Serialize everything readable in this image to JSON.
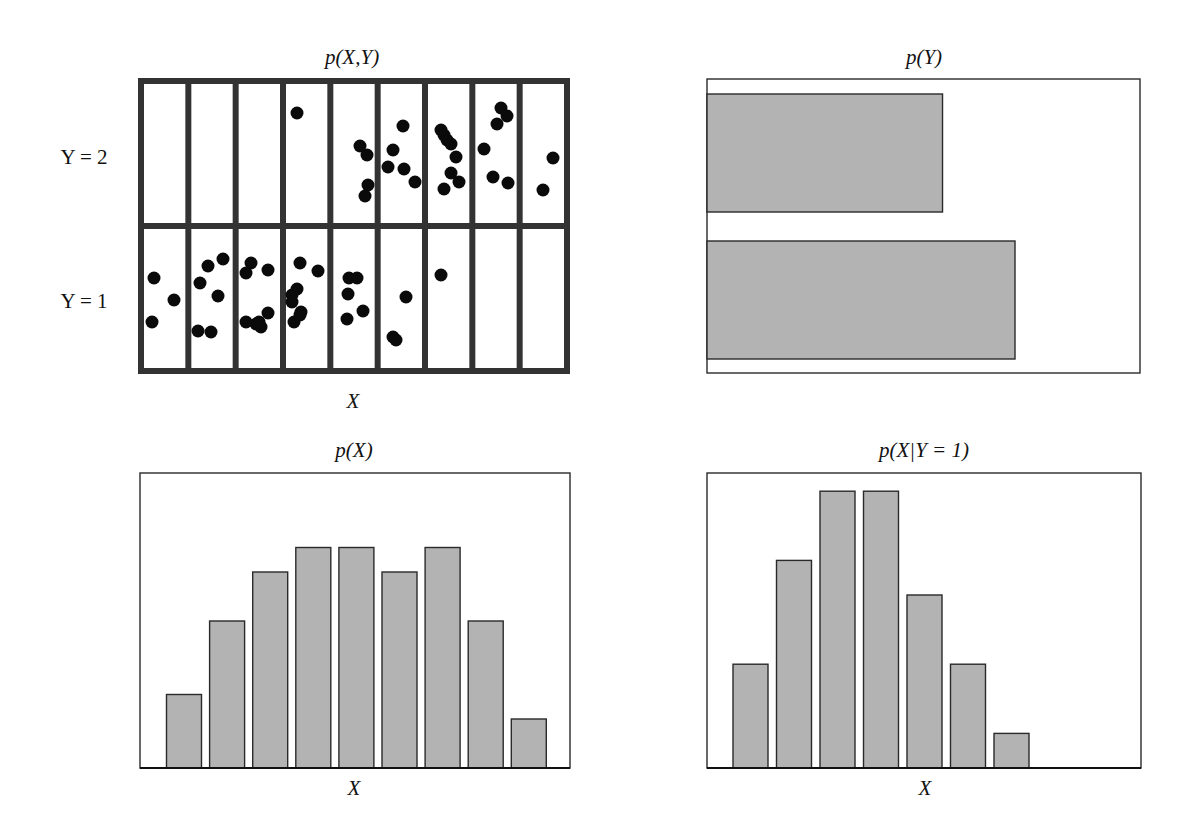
{
  "panels": {
    "joint": {
      "title": "p(X,Y)",
      "xlabel": "X",
      "ylabels": [
        "Y = 2",
        "Y = 1"
      ]
    },
    "marginal_y": {
      "title": "p(Y)"
    },
    "marginal_x": {
      "title": "p(X)",
      "xlabel": "X"
    },
    "conditional": {
      "title": "p(X|Y = 1)",
      "xlabel": "X"
    }
  },
  "colors": {
    "bar_fill": "#b3b3b3",
    "bar_stroke": "#2a2a2a",
    "dot": "#0a0a0a"
  },
  "chart_data": [
    {
      "type": "scatter",
      "title": "p(X,Y)",
      "xlabel": "X",
      "ylabel": "",
      "x_bins": 9,
      "y_categories": [
        "Y = 1",
        "Y = 2"
      ],
      "description": "60 samples binned into a 9x2 grid",
      "counts": {
        "Y = 2": [
          0,
          0,
          0,
          1,
          4,
          5,
          8,
          6,
          2
        ],
        "Y = 1": [
          3,
          6,
          8,
          8,
          5,
          3,
          1,
          0,
          0
        ]
      },
      "points_px": {
        "Y = 2": [
          [
            297,
            113
          ],
          [
            360,
            146
          ],
          [
            367,
            155
          ],
          [
            368,
            185
          ],
          [
            365,
            196
          ],
          [
            403,
            126
          ],
          [
            393,
            150
          ],
          [
            388,
            167
          ],
          [
            404,
            169
          ],
          [
            415,
            182
          ],
          [
            441,
            130
          ],
          [
            444,
            135
          ],
          [
            447,
            140
          ],
          [
            451,
            144
          ],
          [
            456,
            157
          ],
          [
            451,
            173
          ],
          [
            459,
            182
          ],
          [
            444,
            189
          ],
          [
            501,
            108
          ],
          [
            507,
            116
          ],
          [
            497,
            124
          ],
          [
            484,
            149
          ],
          [
            493,
            177
          ],
          [
            508,
            183
          ],
          [
            553,
            158
          ],
          [
            543,
            190
          ]
        ],
        "Y = 1": [
          [
            154,
            278
          ],
          [
            174,
            300
          ],
          [
            152,
            322
          ],
          [
            208,
            266
          ],
          [
            223,
            259
          ],
          [
            200,
            283
          ],
          [
            218,
            296
          ],
          [
            198,
            331
          ],
          [
            211,
            332
          ],
          [
            251,
            263
          ],
          [
            246,
            273
          ],
          [
            268,
            270
          ],
          [
            268,
            313
          ],
          [
            246,
            322
          ],
          [
            259,
            322
          ],
          [
            261,
            327
          ],
          [
            256,
            324
          ],
          [
            300,
            263
          ],
          [
            318,
            271
          ],
          [
            297,
            289
          ],
          [
            292,
            295
          ],
          [
            292,
            302
          ],
          [
            301,
            312
          ],
          [
            294,
            322
          ],
          [
            300,
            315
          ],
          [
            349,
            278
          ],
          [
            357,
            278
          ],
          [
            348,
            294
          ],
          [
            363,
            311
          ],
          [
            347,
            319
          ],
          [
            406,
            297
          ],
          [
            393,
            337
          ],
          [
            396,
            340
          ],
          [
            441,
            275
          ]
        ]
      }
    },
    {
      "type": "bar",
      "orientation": "horizontal",
      "title": "p(Y)",
      "categories": [
        "Y = 2",
        "Y = 1"
      ],
      "values": [
        26,
        34
      ],
      "probabilities": [
        0.433,
        0.567
      ]
    },
    {
      "type": "bar",
      "title": "p(X)",
      "xlabel": "X",
      "categories": [
        "1",
        "2",
        "3",
        "4",
        "5",
        "6",
        "7",
        "8",
        "9"
      ],
      "values": [
        3,
        6,
        8,
        9,
        9,
        8,
        9,
        6,
        2
      ],
      "probabilities": [
        0.05,
        0.1,
        0.133,
        0.15,
        0.15,
        0.133,
        0.15,
        0.1,
        0.033
      ]
    },
    {
      "type": "bar",
      "title": "p(X|Y = 1)",
      "xlabel": "X",
      "categories": [
        "1",
        "2",
        "3",
        "4",
        "5",
        "6",
        "7",
        "8",
        "9"
      ],
      "values": [
        3,
        6,
        8,
        8,
        5,
        3,
        1,
        0,
        0
      ],
      "probabilities": [
        0.088,
        0.176,
        0.235,
        0.235,
        0.147,
        0.088,
        0.029,
        0,
        0
      ]
    }
  ]
}
